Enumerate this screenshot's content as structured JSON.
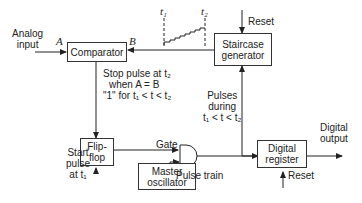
{
  "diagram": {
    "type": "block-diagram",
    "blocks": {
      "comparator": "Comparator",
      "staircase_line1": "Staircase",
      "staircase_line2": "generator",
      "flipflop_line1": "Flip-",
      "flipflop_line2": "flop",
      "oscillator_line1": "Master",
      "oscillator_line2": "oscillator",
      "register_line1": "Digital",
      "register_line2": "register"
    },
    "labels": {
      "analog_input_line1": "Analog",
      "analog_input_line2": "input",
      "port_a": "A",
      "port_b": "B",
      "t1": "t₁",
      "t2": "t₂",
      "reset_staircase": "Reset",
      "stop_line1": "Stop pulse at t₂",
      "stop_line2": "when A = B",
      "stop_line3": "\"1\" for t₁ < t < t₂",
      "pulses_line1": "Pulses",
      "pulses_line2": "during",
      "pulses_line3": "t₁ < t < t₂",
      "gate": "Gate",
      "pulse_train": "Pulse train",
      "start_line1": "Start",
      "start_line2": "pulse",
      "start_line3": "at t₁",
      "digital_output_line1": "Digital",
      "digital_output_line2": "output",
      "reset_register": "Reset"
    },
    "connections": [
      {
        "from": "Analog input",
        "to": "Comparator (A)"
      },
      {
        "from": "Staircase generator",
        "to": "Comparator (B)"
      },
      {
        "from": "Comparator",
        "to": "Flip-flop",
        "label": "Stop pulse at t2 when A = B"
      },
      {
        "from": "Start pulse at t1",
        "to": "Flip-flop"
      },
      {
        "from": "Flip-flop",
        "to": "AND gate",
        "label": "Gate"
      },
      {
        "from": "Master oscillator",
        "to": "AND gate",
        "label": "Pulse train"
      },
      {
        "from": "AND gate",
        "to": "Staircase generator",
        "label": "Pulses during t1 < t < t2"
      },
      {
        "from": "AND gate",
        "to": "Digital register"
      },
      {
        "from": "Digital register",
        "to": "Digital output"
      },
      {
        "from": "Reset",
        "to": "Staircase generator"
      },
      {
        "from": "Reset",
        "to": "Digital register"
      }
    ]
  }
}
